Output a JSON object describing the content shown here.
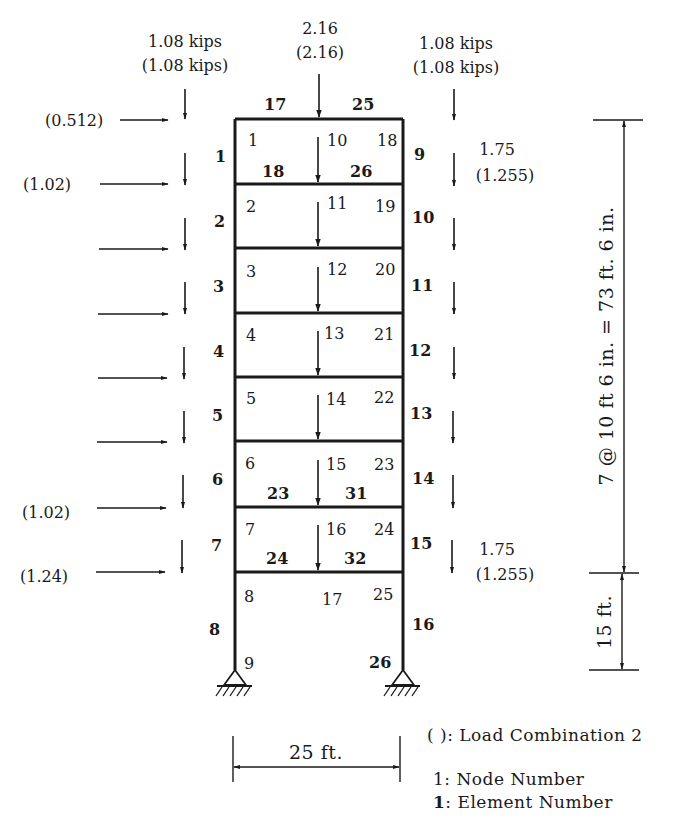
{
  "diagram": {
    "type": "structural-frame",
    "title_loads": {
      "left_top": {
        "value": "1.08 kips",
        "combo2": "(1.08 kips)"
      },
      "center_top": {
        "value": "2.16",
        "combo2": "(2.16)"
      },
      "right_top": {
        "value": "1.08 kips",
        "combo2": "(1.08 kips)"
      }
    },
    "lateral_loads": {
      "top": "(0.512)",
      "level1": "(1.02)",
      "level6": "(1.02)",
      "bottom": "(1.24)"
    },
    "right_side_loads": {
      "upper": {
        "value": "1.75",
        "combo2": "(1.255)"
      },
      "lower": {
        "value": "1.75",
        "combo2": "(1.255)"
      }
    },
    "left_elements": [
      "1",
      "2",
      "3",
      "4",
      "5",
      "6",
      "7",
      "8"
    ],
    "right_elements": [
      "9",
      "10",
      "11",
      "12",
      "13",
      "14",
      "15",
      "16"
    ],
    "top_beam_elements": {
      "left": "17",
      "right": "25"
    },
    "beam_elements": {
      "floor1_left": "18",
      "floor1_right": "26",
      "floor6_left": "23",
      "floor6_right": "31",
      "floor7_left": "24",
      "floor7_right": "32"
    },
    "left_nodes": [
      "1",
      "2",
      "3",
      "4",
      "5",
      "6",
      "7",
      "8",
      "9"
    ],
    "center_nodes": [
      "10",
      "11",
      "12",
      "13",
      "14",
      "15",
      "16",
      "17"
    ],
    "right_nodes": [
      "18",
      "19",
      "20",
      "21",
      "22",
      "23",
      "24",
      "25",
      "26"
    ],
    "dimensions": {
      "upper_height": "7 @ 10 ft 6 in. = 73 ft. 6 in.",
      "lower_height": "15 ft.",
      "width": "25 ft."
    },
    "legend": {
      "combo": "( ): Load Combination 2",
      "node": "1: Node Number",
      "element_num": "1",
      "element_text": ": Element Number"
    }
  }
}
